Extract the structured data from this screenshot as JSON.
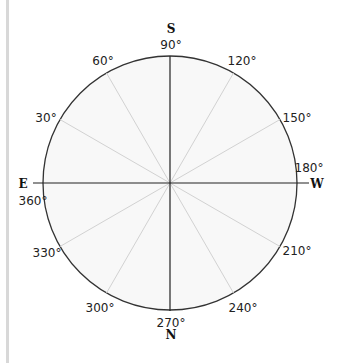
{
  "diagram": {
    "type": "compass-circle",
    "center": {
      "x": 170,
      "y": 183
    },
    "radius": 127,
    "colors": {
      "circle_stroke": "#333333",
      "axis_stroke": "#222222",
      "spoke_stroke": "#d0d0d0",
      "fill": "#f7f7f7"
    },
    "directions": {
      "top": "S",
      "bottom": "N",
      "left": "E",
      "right": "W"
    },
    "degree_labels": {
      "d90": "90°",
      "d120": "120°",
      "d150": "150°",
      "d180": "180°",
      "d210": "210°",
      "d240": "240°",
      "d270": "270°",
      "d300": "300°",
      "d330": "330°",
      "d360": "360°",
      "d30": "30°",
      "d60": "60°"
    }
  }
}
